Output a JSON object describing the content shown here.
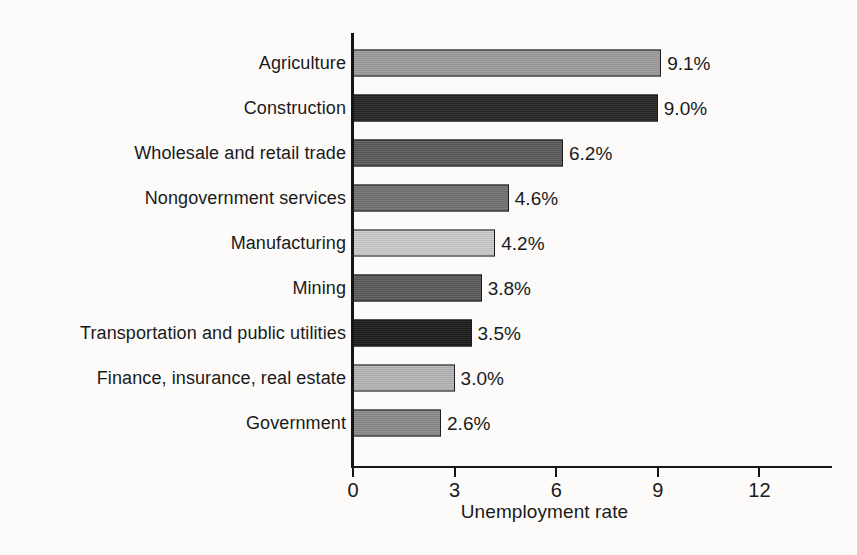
{
  "chart_data": {
    "type": "bar",
    "orientation": "horizontal",
    "title": "",
    "xlabel": "Unemployment rate",
    "ylabel": "",
    "xlim": [
      0,
      14.2
    ],
    "grid": false,
    "legend": null,
    "xticks": [
      0,
      3,
      6,
      9,
      12
    ],
    "xtick_labels": [
      "0",
      "3",
      "6",
      "9",
      "12"
    ],
    "categories": [
      "Agriculture",
      "Construction",
      "Wholesale and retail trade",
      "Nongovernment services",
      "Manufacturing",
      "Mining",
      "Transportation and public utilities",
      "Finance, insurance, real estate",
      "Government"
    ],
    "values": [
      9.1,
      9.0,
      6.2,
      4.6,
      4.2,
      3.8,
      3.5,
      3.0,
      2.6
    ],
    "value_labels": [
      "9.1%",
      "9.0%",
      "6.2%",
      "4.6%",
      "4.2%",
      "3.8%",
      "3.5%",
      "3.0%",
      "2.6%"
    ],
    "bar_colors": [
      "#9b9b9b",
      "#262626",
      "#5a5a5a",
      "#717171",
      "#c9c9c9",
      "#5b5b5b",
      "#1c1c1c",
      "#b4b4b4",
      "#8a8a8a"
    ],
    "bar_outline_color": "#1b1b1b",
    "axis_color": "#151515",
    "background_color": "#fcfbfa",
    "text_color": "#1a1a1a"
  }
}
